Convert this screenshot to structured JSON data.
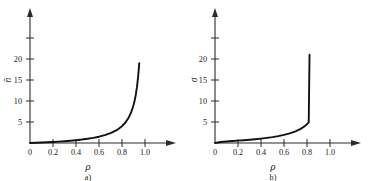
{
  "figure": {
    "background_color": "#ffffff",
    "ink_color": "#111111",
    "panels": [
      {
        "id": "a",
        "caption": "a)",
        "ylabel": "n̄",
        "ylabel_plain": "n-bar",
        "xlabel": "ρ",
        "xlabel_plain": "rho",
        "y_ticks": [
          "5",
          "10",
          "15",
          "20"
        ],
        "x_ticks": [
          "0",
          "0.2",
          "0.4",
          "0.6",
          "0.8",
          "1.0"
        ]
      },
      {
        "id": "b",
        "caption": "b)",
        "ylabel": "σ",
        "ylabel_plain": "sigma",
        "xlabel": "ρ",
        "xlabel_plain": "rho",
        "y_ticks": [
          "5",
          "10",
          "15",
          "20"
        ],
        "x_ticks": [
          "0",
          "0.2",
          "0.4",
          "0.6",
          "0.8",
          "1.0"
        ]
      }
    ]
  },
  "chart_data": [
    {
      "type": "line",
      "panel": "a",
      "title": "",
      "xlabel": "ρ",
      "ylabel": "n̄",
      "xlim": [
        0,
        1.2
      ],
      "ylim": [
        0,
        23
      ],
      "xticks": [
        0,
        0.2,
        0.4,
        0.6,
        0.8,
        1.0
      ],
      "xticklabels": [
        "0",
        "0.2",
        "0.4",
        "0.6",
        "0.8",
        "1.0"
      ],
      "yticks": [
        5,
        10,
        15,
        20
      ],
      "yticklabels": [
        "5",
        "10",
        "15",
        "20"
      ],
      "grid": false,
      "legend": false,
      "annotation": "a)",
      "series": [
        {
          "name": "mean number in system",
          "formula": "n = rho/(1-rho)",
          "x": [
            0.0,
            0.05,
            0.1,
            0.15,
            0.2,
            0.25,
            0.3,
            0.35,
            0.4,
            0.45,
            0.5,
            0.55,
            0.6,
            0.65,
            0.7,
            0.75,
            0.8,
            0.83,
            0.86,
            0.88,
            0.9,
            0.91,
            0.92,
            0.93,
            0.94,
            0.95
          ],
          "y": [
            0.0,
            0.05,
            0.11,
            0.18,
            0.25,
            0.33,
            0.43,
            0.54,
            0.67,
            0.82,
            1.0,
            1.22,
            1.5,
            1.86,
            2.33,
            3.0,
            4.0,
            4.88,
            6.14,
            7.33,
            9.0,
            10.11,
            11.5,
            13.29,
            15.67,
            19.0
          ]
        }
      ]
    },
    {
      "type": "line",
      "panel": "b",
      "title": "",
      "xlabel": "ρ",
      "ylabel": "σ",
      "xlim": [
        0,
        1.2
      ],
      "ylim": [
        0,
        23
      ],
      "xticks": [
        0,
        0.2,
        0.4,
        0.6,
        0.8,
        1.0
      ],
      "xticklabels": [
        "0",
        "0.2",
        "0.4",
        "0.6",
        "0.8",
        "1.0"
      ],
      "yticks": [
        5,
        10,
        15,
        20
      ],
      "yticklabels": [
        "5",
        "10",
        "15",
        "20"
      ],
      "grid": false,
      "legend": false,
      "annotation": "b)",
      "series": [
        {
          "name": "standard deviation of number in system",
          "formula": "sigma = sqrt(rho)/(1-rho)",
          "x": [
            0.0,
            0.05,
            0.1,
            0.15,
            0.2,
            0.25,
            0.3,
            0.35,
            0.4,
            0.45,
            0.5,
            0.55,
            0.6,
            0.65,
            0.7,
            0.74,
            0.77,
            0.79,
            0.805,
            0.815,
            0.822
          ],
          "y": [
            0.0,
            0.24,
            0.35,
            0.46,
            0.56,
            0.67,
            0.78,
            0.91,
            1.05,
            1.22,
            1.41,
            1.65,
            1.94,
            2.3,
            2.79,
            3.31,
            3.81,
            4.24,
            4.62,
            4.91,
            21.0
          ]
        }
      ]
    }
  ]
}
